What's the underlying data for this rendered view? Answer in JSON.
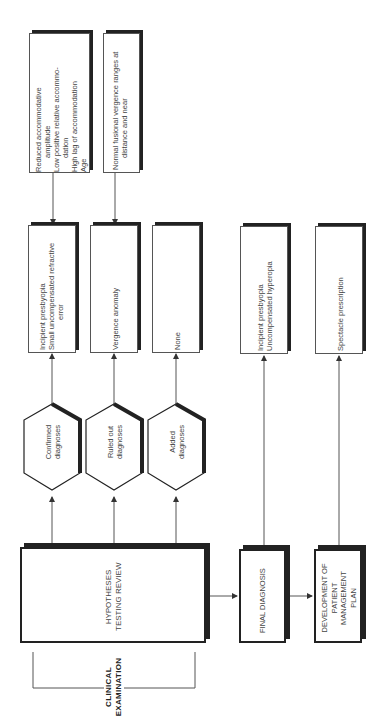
{
  "diagram": {
    "orientation": "rotated 90° counter-clockwise (read bottom-to-top)",
    "start": {
      "label_line1": "CLINICAL",
      "label_line2": "EXAMINATION"
    },
    "hypotheses_review": {
      "line1": "HYPOTHESES",
      "line2": "TESTING REVIEW"
    },
    "outcomes": [
      {
        "hexagon_line1": "Confirmed",
        "hexagon_line2": "diagnoses",
        "result_lines": [
          "Incipient presbyopia",
          "Small uncompensated refractive",
          "error"
        ],
        "evidence_lines": [
          "Reduced accommodative",
          "amplitude",
          "Low positive relative accommo-",
          "dation",
          "High lag of accommodation",
          "Age"
        ]
      },
      {
        "hexagon_line1": "Ruled out",
        "hexagon_line2": "diagnoses",
        "result_lines": [
          "Vergence anomaly"
        ],
        "evidence_lines": [
          "Normal fusional vergence ranges at",
          "distance and near"
        ]
      },
      {
        "hexagon_line1": "Added",
        "hexagon_line2": "diagnoses",
        "result_lines": [
          "None"
        ]
      }
    ],
    "final_diagnosis": {
      "label": "FINAL DIAGNOSIS",
      "result_lines": [
        "Incipient presbyopia",
        "Uncompensated hyperopia"
      ]
    },
    "management_plan": {
      "line1": "DEVELOPMENT OF",
      "line2": "PATIENT",
      "line3": "MANAGEMENT",
      "line4": "PLAN",
      "result_lines": [
        "Spectacle prescription"
      ]
    }
  }
}
